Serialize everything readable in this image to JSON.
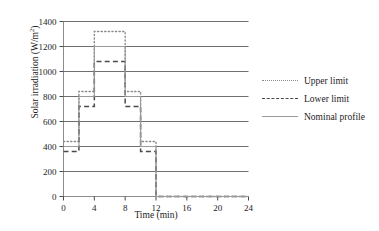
{
  "chart_data": {
    "type": "line",
    "title": "",
    "xlabel": "Time (min)",
    "ylabel": "Solar irradiation (W/m²)",
    "ylabel_base": "Solar irradiation (W/m",
    "ylabel_sup": "2",
    "ylabel_tail": ")",
    "xlim": [
      0,
      24
    ],
    "ylim": [
      0,
      1400
    ],
    "xticks": [
      0,
      4,
      8,
      12,
      16,
      20,
      24
    ],
    "yticks": [
      0,
      200,
      400,
      600,
      800,
      1000,
      1200,
      1400
    ],
    "xtick_labels": [
      "0",
      "4",
      "8",
      "12",
      "16",
      "20",
      "24"
    ],
    "ytick_labels": [
      "0",
      "200",
      "400",
      "600",
      "800",
      "1000",
      "1200",
      "1400"
    ],
    "grid": "horizontal",
    "legend_position": "right-outside",
    "step_breakpoints": [
      0,
      2,
      4,
      8,
      10,
      12,
      24
    ],
    "series": [
      {
        "name": "Upper limit",
        "style": "dotted",
        "color": "#8a8a8a",
        "step_values": [
          440,
          840,
          1320,
          840,
          440,
          0
        ]
      },
      {
        "name": "Lower limit",
        "style": "dashed",
        "color": "#4a4a4a",
        "step_values": [
          360,
          720,
          1080,
          720,
          360,
          0
        ]
      },
      {
        "name": "Nominal profile",
        "style": "solid",
        "color": "#9a9a9a",
        "step_values": [
          400,
          800,
          1200,
          800,
          400,
          0
        ]
      }
    ],
    "legend": [
      {
        "label": "Upper limit",
        "style": "dotted"
      },
      {
        "label": "Lower limit",
        "style": "dashed"
      },
      {
        "label": "Nominal profile",
        "style": "solid"
      }
    ]
  }
}
